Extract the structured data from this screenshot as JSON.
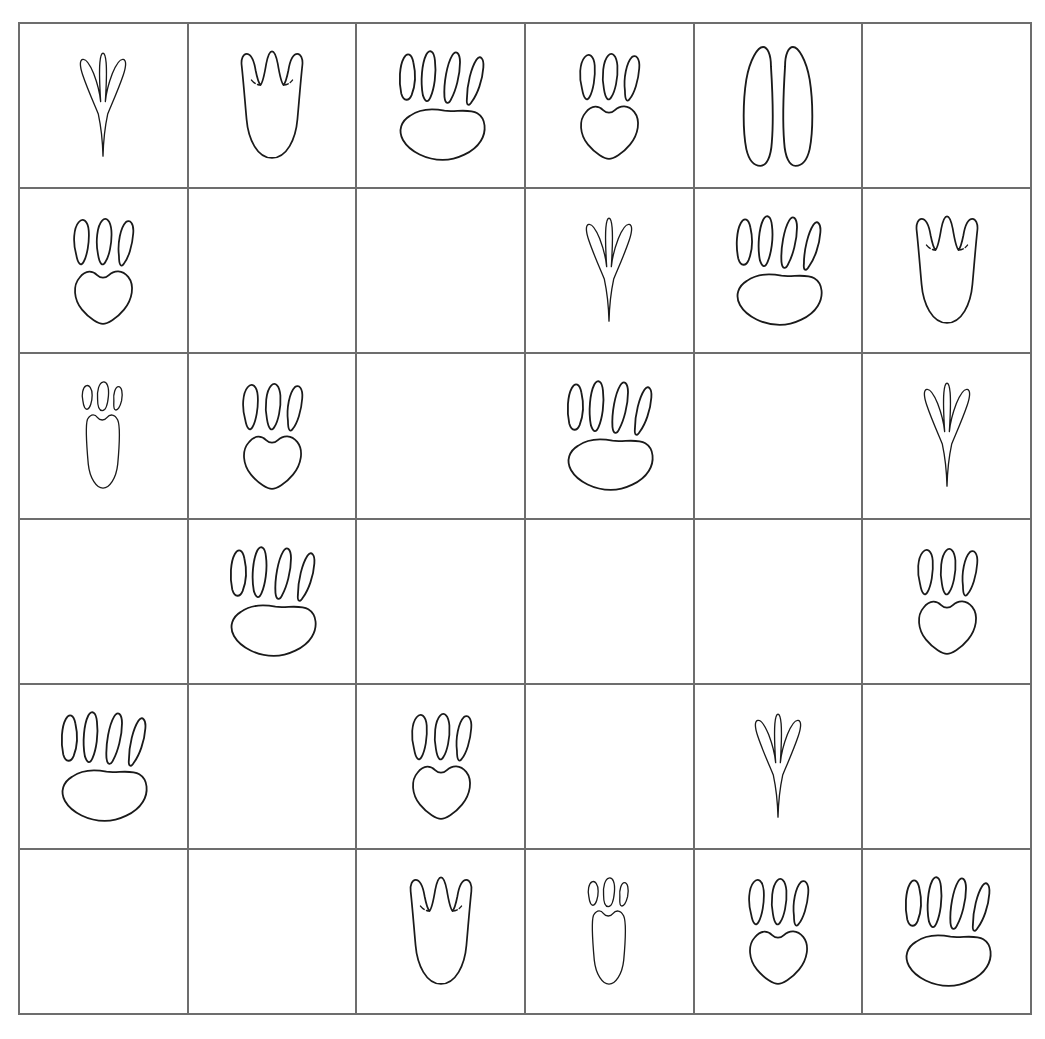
{
  "puzzle": {
    "kind": "animal-track-sudoku",
    "rows": 6,
    "columns": 6,
    "background_color": "#ffffff",
    "grid_line_color": "#6d6d6d",
    "glyph_stroke_color": "#1a1a1a",
    "empty_label": ""
  },
  "symbols": {
    "bird": {
      "key": "bird",
      "icon_name": "bird-track-icon",
      "label": "bird track"
    },
    "duck": {
      "key": "duck",
      "icon_name": "duck-webbed-track-icon",
      "label": "webbed duck track"
    },
    "badger": {
      "key": "badger",
      "icon_name": "badger-four-toe-track-icon",
      "label": "four-toe wide-pad track"
    },
    "dog": {
      "key": "dog",
      "icon_name": "dog-three-toe-track-icon",
      "label": "three-toe heart-pad track"
    },
    "deer": {
      "key": "deer",
      "icon_name": "deer-hoof-track-icon",
      "label": "cloven hoof track"
    },
    "rabbit": {
      "key": "rabbit",
      "icon_name": "rabbit-narrow-track-icon",
      "label": "narrow three-toe track"
    },
    "empty": {
      "key": "empty",
      "icon_name": "empty-cell",
      "label": ""
    }
  },
  "grid": [
    [
      "bird",
      "duck",
      "badger",
      "dog",
      "deer",
      "empty"
    ],
    [
      "dog",
      "empty",
      "empty",
      "bird",
      "badger",
      "duck"
    ],
    [
      "rabbit",
      "dog",
      "empty",
      "badger",
      "empty",
      "bird"
    ],
    [
      "empty",
      "badger",
      "empty",
      "empty",
      "empty",
      "dog"
    ],
    [
      "badger",
      "empty",
      "dog",
      "empty",
      "bird",
      "empty"
    ],
    [
      "empty",
      "empty",
      "duck",
      "rabbit",
      "dog",
      "badger"
    ]
  ]
}
